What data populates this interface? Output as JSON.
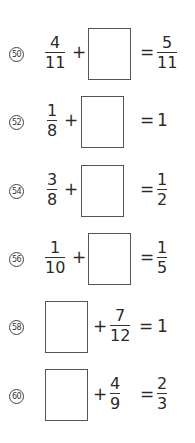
{
  "problems": [
    {
      "number": "50",
      "a": {
        "num": "4",
        "den": "11"
      },
      "op": "+",
      "eq": "=",
      "result": {
        "num": "5",
        "den": "11"
      }
    },
    {
      "number": "52",
      "a": {
        "num": "1",
        "den": "8"
      },
      "op": "+",
      "eq": "=",
      "result": "1"
    },
    {
      "number": "54",
      "a": {
        "num": "3",
        "den": "8"
      },
      "op": "+",
      "eq": "=",
      "result": {
        "num": "1",
        "den": "2"
      }
    },
    {
      "number": "56",
      "a": {
        "num": "1",
        "den": "10"
      },
      "op": "+",
      "eq": "=",
      "result": {
        "num": "1",
        "den": "5"
      }
    },
    {
      "number": "58",
      "b": {
        "num": "7",
        "den": "12"
      },
      "op": "+",
      "eq": "=",
      "result": "1"
    },
    {
      "number": "60",
      "b": {
        "num": "4",
        "den": "9"
      },
      "op": "+",
      "eq": "=",
      "result": {
        "num": "2",
        "den": "3"
      }
    }
  ]
}
